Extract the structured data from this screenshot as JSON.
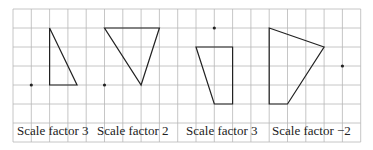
{
  "grid": {
    "left": 13,
    "top": 9,
    "cols": 19,
    "rows": 7,
    "cell_w": 18.3,
    "cell_h": 19,
    "line_color": "#b8b8b8",
    "shape_color": "#222222"
  },
  "diagrams": [
    {
      "label": "Scale factor 3",
      "label_x": 17,
      "shape": [
        [
          2,
          1
        ],
        [
          2,
          4
        ],
        [
          3.5,
          4
        ]
      ],
      "center": [
        1,
        4
      ]
    },
    {
      "label": "Scale factor 2",
      "label_x": 97,
      "shape": [
        [
          5,
          1
        ],
        [
          8,
          1
        ],
        [
          7,
          4
        ]
      ],
      "center": [
        5,
        4
      ]
    },
    {
      "label": "Scale factor 3",
      "label_x": 186,
      "shape": [
        [
          10,
          2
        ],
        [
          12,
          2
        ],
        [
          12,
          5
        ],
        [
          11,
          5
        ]
      ],
      "center": [
        11,
        1
      ]
    },
    {
      "label": "Scale factor −2",
      "label_x": 272,
      "shape": [
        [
          14,
          1
        ],
        [
          17,
          2
        ],
        [
          15,
          5
        ],
        [
          14,
          5
        ]
      ],
      "center": [
        18,
        3
      ]
    }
  ]
}
